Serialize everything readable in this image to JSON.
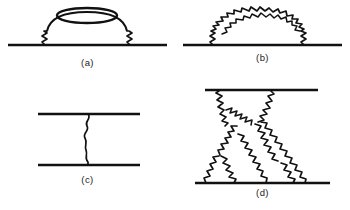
{
  "figure": {
    "background_color": "#ffffff",
    "ink_color": "#111111",
    "panel_count": 4
  },
  "panels": [
    {
      "id": "a",
      "caption": "(a)",
      "name": "vacuum-polarization-insertion-diagram",
      "description": "Horizontal straight fermion line with two short wavy photon legs rising from it to a smooth arc that carries a closed elliptical fermion loop at the top.",
      "elements": [
        {
          "type": "straight-line",
          "role": "fermion-line",
          "orientation": "horizontal"
        },
        {
          "type": "wavy-line",
          "role": "photon-leg-left",
          "orientation": "vertical"
        },
        {
          "type": "wavy-line",
          "role": "photon-leg-right",
          "orientation": "vertical"
        },
        {
          "type": "arc",
          "role": "photon-arc",
          "orientation": "over"
        },
        {
          "type": "ellipse",
          "role": "fermion-loop",
          "orientation": "horizontal"
        }
      ]
    },
    {
      "id": "b",
      "caption": "(b)",
      "name": "nested-self-energy-diagram",
      "description": "Horizontal straight fermion line with a large wavy photon arc spanning over it and a second nested wavy photon arc inside the first.",
      "elements": [
        {
          "type": "straight-line",
          "role": "fermion-line",
          "orientation": "horizontal"
        },
        {
          "type": "wavy-arc",
          "role": "outer-photon-arc",
          "orientation": "over"
        },
        {
          "type": "wavy-arc",
          "role": "inner-photon-arc",
          "orientation": "over"
        }
      ]
    },
    {
      "id": "c",
      "caption": "(c)",
      "name": "single-photon-exchange-diagram",
      "description": "Two parallel horizontal straight fermion lines joined by a single vertical wavy photon exchange line.",
      "elements": [
        {
          "type": "straight-line",
          "role": "fermion-line-upper",
          "orientation": "horizontal"
        },
        {
          "type": "straight-line",
          "role": "fermion-line-lower",
          "orientation": "horizontal"
        },
        {
          "type": "wavy-line",
          "role": "photon-exchange",
          "orientation": "vertical"
        }
      ]
    },
    {
      "id": "d",
      "caption": "(d)",
      "name": "multi-photon-exchange-diagram",
      "description": "Two horizontal straight fermion lines, the upper one short and the lower one long, connected by a dense web of wavy photon lines forming crossed triangular exchanges with several internal vertices.",
      "elements": [
        {
          "type": "straight-line",
          "role": "fermion-line-upper",
          "orientation": "horizontal"
        },
        {
          "type": "straight-line",
          "role": "fermion-line-lower",
          "orientation": "horizontal"
        },
        {
          "type": "wavy-line",
          "role": "photon-exchange-upper-left",
          "orientation": "diagonal"
        },
        {
          "type": "wavy-line",
          "role": "photon-exchange-upper-right",
          "orientation": "diagonal"
        },
        {
          "type": "wavy-line",
          "role": "photon-exchange-middle-left",
          "orientation": "diagonal"
        },
        {
          "type": "wavy-line",
          "role": "photon-exchange-middle-right",
          "orientation": "diagonal"
        },
        {
          "type": "wavy-line",
          "role": "photon-exchange-lower-left",
          "orientation": "diagonal"
        },
        {
          "type": "wavy-line",
          "role": "photon-exchange-lower-right",
          "orientation": "diagonal"
        },
        {
          "type": "wavy-line",
          "role": "photon-exchange-center",
          "orientation": "diagonal"
        }
      ]
    }
  ]
}
